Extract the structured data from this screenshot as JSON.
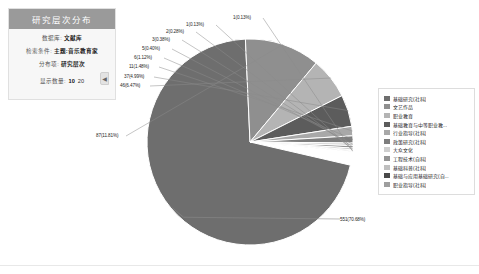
{
  "panel": {
    "title": "研究层次分布",
    "rows": [
      {
        "label": "数据库:",
        "value": "文献库"
      },
      {
        "label": "检索条件:",
        "value": "主题:音乐教育家"
      },
      {
        "label": "分布项:",
        "value": "研究层次"
      }
    ],
    "count_label": "显示数量:",
    "count_options": [
      "10",
      "20"
    ],
    "count_selected": "10",
    "collapse_icon": "◀"
  },
  "chart_data": {
    "type": "pie",
    "title": "研究层次分布",
    "legend_position": "right",
    "total": 780,
    "categories": [
      "基础研究(社科)",
      "文艺作品",
      "职业教育",
      "基础教育与中等职业教...",
      "行业指导(社科)",
      "政策研究(社科)",
      "大众文化",
      "工程技术(自科)",
      "基础科普(社科)",
      "基础与应用基础研究(自...",
      "职业指导(社科)"
    ],
    "values": [
      551,
      87,
      46,
      37,
      11,
      6,
      5,
      3,
      2,
      1,
      1
    ],
    "percents": [
      70.68,
      11.81,
      6.47,
      4.99,
      1.48,
      1.12,
      0.4,
      0.38,
      0.28,
      0.13,
      0.13
    ],
    "labels": [
      "551(70.68%)",
      "87(11.81%)",
      "46(6.47%)",
      "37(4.99%)",
      "11(1.48%)",
      "6(1.12%)",
      "5(0.40%)",
      "3(0.38%)",
      "2(0.28%)",
      "1(0.13%)",
      "1(0.13%)"
    ],
    "colors": [
      "#6e6e6e",
      "#8f8f8f",
      "#b4b4b4",
      "#5c5c5c",
      "#a8a8a8",
      "#7d7d7d",
      "#cfcfcf",
      "#949494",
      "#bfbfbf",
      "#4a4a4a",
      "#9e9e9e"
    ]
  }
}
